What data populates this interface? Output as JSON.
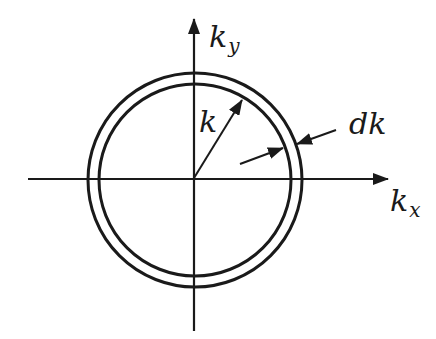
{
  "diagram": {
    "title": "",
    "colors": {
      "stroke": "#1a1a1a",
      "background": "#ffffff"
    },
    "axes": {
      "x": {
        "label_main": "k",
        "label_sub": "x"
      },
      "y": {
        "label_main": "k",
        "label_sub": "y"
      }
    },
    "circles": [
      {
        "name": "outer",
        "radius_px": 107
      },
      {
        "name": "inner",
        "radius_px": 96
      }
    ],
    "radius_label": "k",
    "shell_thickness_label": "dk"
  }
}
